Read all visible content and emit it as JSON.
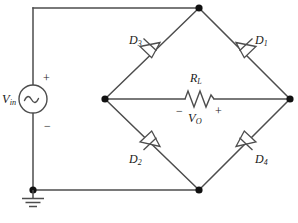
{
  "diagram": {
    "colors": {
      "wire": "#4d4d4d",
      "node": "#111111",
      "text": "#1a1a1a",
      "background": "#ffffff"
    },
    "source": {
      "label_main": "V",
      "label_sub": "in",
      "plus_sign": "+",
      "minus_sign": "−",
      "symbol": "ac-source-sine"
    },
    "load": {
      "label_main": "R",
      "label_sub": "L",
      "output_main": "V",
      "output_sub": "O",
      "minus_sign": "−",
      "plus_sign": "+",
      "symbol": "resistor-zigzag"
    },
    "diodes": [
      {
        "id": "d3",
        "label_main": "D",
        "label_sub": "3",
        "position": "upper-left",
        "direction": "toward-left-node"
      },
      {
        "id": "d1",
        "label_main": "D",
        "label_sub": "1",
        "position": "upper-right",
        "direction": "toward-right-node"
      },
      {
        "id": "d2",
        "label_main": "D",
        "label_sub": "2",
        "position": "lower-left",
        "direction": "toward-bottom-node"
      },
      {
        "id": "d4",
        "label_main": "D",
        "label_sub": "4",
        "position": "lower-right",
        "direction": "toward-bottom-node"
      }
    ],
    "ground": {
      "symbol": "earth-ground"
    }
  }
}
